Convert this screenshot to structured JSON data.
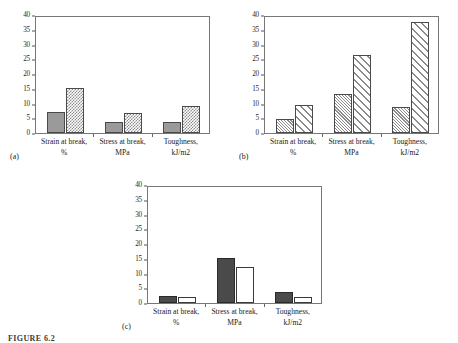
{
  "figure": {
    "caption": "FIGURE 6.2",
    "panel_count": 3
  },
  "axis": {
    "ticks": [
      "0",
      "5",
      "10",
      "15",
      "20",
      "25",
      "30",
      "35",
      "40"
    ],
    "min": 0,
    "max": 40,
    "step": 5
  },
  "categories": [
    {
      "line1": "Strain at break,",
      "line2": "%"
    },
    {
      "line1": "Stress at break,",
      "line2": "MPa"
    },
    {
      "line1": "Toughness,",
      "line2": "kJ/m2"
    }
  ],
  "panels": [
    {
      "letter": "(a)",
      "series": [
        {
          "name": "series-1",
          "fill": "solid-gray",
          "values": [
            7.2,
            3.8,
            3.9
          ]
        },
        {
          "name": "series-2",
          "fill": "checker",
          "values": [
            15.4,
            6.7,
            9.2
          ]
        }
      ]
    },
    {
      "letter": "(b)",
      "series": [
        {
          "name": "series-1",
          "fill": "hatch-dense",
          "values": [
            4.6,
            13.2,
            8.7
          ]
        },
        {
          "name": "series-2",
          "fill": "hatch-wide",
          "values": [
            9.6,
            26.3,
            37.8
          ]
        }
      ]
    },
    {
      "letter": "(c)",
      "series": [
        {
          "name": "series-1",
          "fill": "solid-dark",
          "values": [
            2.4,
            15.2,
            3.6
          ]
        },
        {
          "name": "series-2",
          "fill": "white",
          "values": [
            1.9,
            12.3,
            2.1
          ]
        }
      ]
    }
  ],
  "chart_data": [
    {
      "type": "bar",
      "title": "(a)",
      "categories": [
        "Strain at break, %",
        "Stress at break, MPa",
        "Toughness, kJ/m2"
      ],
      "series": [
        {
          "name": "Series 1",
          "values": [
            7.2,
            3.8,
            3.9
          ],
          "pattern": "solid gray"
        },
        {
          "name": "Series 2",
          "values": [
            15.4,
            6.7,
            9.2
          ],
          "pattern": "checkered"
        }
      ],
      "xlabel": "",
      "ylabel": "",
      "ylim": [
        0,
        40
      ],
      "yticks": [
        0,
        5,
        10,
        15,
        20,
        25,
        30,
        35,
        40
      ],
      "grid": false,
      "legend": "none"
    },
    {
      "type": "bar",
      "title": "(b)",
      "categories": [
        "Strain at break, %",
        "Stress at break, MPa",
        "Toughness, kJ/m2"
      ],
      "series": [
        {
          "name": "Series 1",
          "values": [
            4.6,
            13.2,
            8.7
          ],
          "pattern": "dense diagonal hatch"
        },
        {
          "name": "Series 2",
          "values": [
            9.6,
            26.3,
            37.8
          ],
          "pattern": "wide diagonal hatch"
        }
      ],
      "xlabel": "",
      "ylabel": "",
      "ylim": [
        0,
        40
      ],
      "yticks": [
        0,
        5,
        10,
        15,
        20,
        25,
        30,
        35,
        40
      ],
      "grid": false,
      "legend": "none"
    },
    {
      "type": "bar",
      "title": "(c)",
      "categories": [
        "Strain at break, %",
        "Stress at break, MPa",
        "Toughness, kJ/m2"
      ],
      "series": [
        {
          "name": "Series 1",
          "values": [
            2.4,
            15.2,
            3.6
          ],
          "pattern": "solid dark gray"
        },
        {
          "name": "Series 2",
          "values": [
            1.9,
            12.3,
            2.1
          ],
          "pattern": "white / hollow"
        }
      ],
      "xlabel": "",
      "ylabel": "",
      "ylim": [
        0,
        40
      ],
      "yticks": [
        0,
        5,
        10,
        15,
        20,
        25,
        30,
        35,
        40
      ],
      "grid": false,
      "legend": "none"
    }
  ]
}
